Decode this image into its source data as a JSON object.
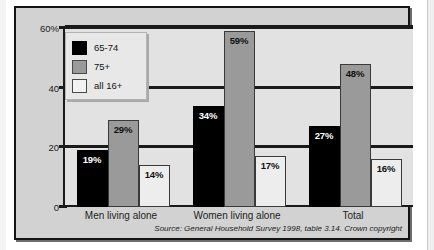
{
  "chart_data": {
    "type": "bar",
    "title": "",
    "xlabel": "",
    "ylabel": "",
    "ylim": [
      0,
      60
    ],
    "yticks": [
      0,
      20,
      40,
      60
    ],
    "ytick_labels": [
      "0",
      "20",
      "40",
      "60%"
    ],
    "grid": true,
    "legend_position": "upper-left-inside",
    "categories": [
      "Men living alone",
      "Women living alone",
      "Total"
    ],
    "series": [
      {
        "name": "65-74",
        "color": "#000000",
        "values": [
          19,
          34,
          27
        ],
        "labels": [
          "19%",
          "34%",
          "27%"
        ]
      },
      {
        "name": "75+",
        "color": "#9a9a9a",
        "values": [
          29,
          59,
          48
        ],
        "labels": [
          "29%",
          "59%",
          "48%"
        ]
      },
      {
        "name": "all 16+",
        "color": "#ededed",
        "values": [
          14,
          17,
          16
        ],
        "labels": [
          "14%",
          "17%",
          "16%"
        ]
      }
    ],
    "source_note": "Source: General Household Survey 1998, table 3.14. Crown copyright"
  },
  "legend": {
    "items": [
      {
        "label": "65-74"
      },
      {
        "label": "75+"
      },
      {
        "label": "all 16+"
      }
    ]
  },
  "axis": {
    "y_labels": [
      "60%",
      "40",
      "20",
      "0"
    ]
  },
  "footer": {
    "source": "Source: General Household Survey 1998, table 3.14. Crown copyright"
  }
}
